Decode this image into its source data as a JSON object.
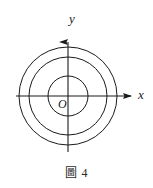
{
  "figure": {
    "caption": "圖 4",
    "background_color": "#ffffff",
    "stroke_color": "#1a1a1a"
  },
  "labels": {
    "x_axis": "x",
    "y_axis": "y",
    "origin": "O"
  },
  "chart_data": {
    "type": "scatter",
    "title": "圖 4",
    "xlabel": "x",
    "ylabel": "y",
    "grid": false,
    "legend": "none",
    "axes": {
      "origin_label": "O",
      "origin_px": [
        68,
        96
      ],
      "x_axis": {
        "label": "x",
        "start_px": [
          16,
          96
        ],
        "end_px": [
          134,
          96
        ],
        "arrow": "right"
      },
      "y_axis": {
        "label": "y",
        "start_px": [
          68,
          152
        ],
        "end_px": [
          68,
          33
        ],
        "arrow": "up"
      }
    },
    "shapes": [
      {
        "name": "inner-circle",
        "type": "circle",
        "center": [
          0,
          0
        ],
        "center_px": [
          68,
          96
        ],
        "radius_px": 20,
        "fill": "none",
        "stroke": "#1a1a1a"
      },
      {
        "name": "middle-circle",
        "type": "circle",
        "center": [
          0,
          0
        ],
        "center_px": [
          68,
          96
        ],
        "radius_px": 39,
        "fill": "none",
        "stroke": "#1a1a1a"
      },
      {
        "name": "outer-circle",
        "type": "circle",
        "center": [
          0,
          0
        ],
        "center_px": [
          68,
          96
        ],
        "radius_px": 49,
        "fill": "none",
        "stroke": "#1a1a1a"
      }
    ]
  }
}
